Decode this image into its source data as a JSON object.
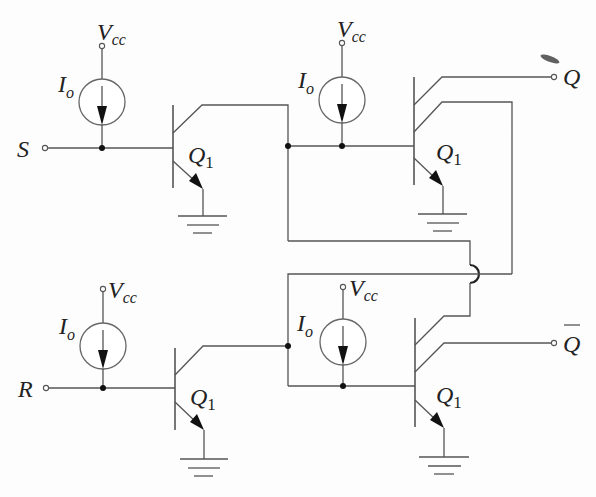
{
  "diagram": {
    "type": "circuit-schematic",
    "inputs": [
      {
        "name": "S",
        "label": "S"
      },
      {
        "name": "R",
        "label": "R"
      }
    ],
    "outputs": [
      {
        "name": "Q",
        "label": "Q"
      },
      {
        "name": "Q_bar",
        "label": "Q",
        "overline": true
      }
    ],
    "supply": {
      "label_main": "V",
      "label_sub": "cc"
    },
    "current_source": {
      "label_main": "I",
      "label_sub": "o"
    },
    "transistor": {
      "label_main": "Q",
      "label_sub": "1"
    },
    "cells": [
      {
        "id": "top-left",
        "input": "S",
        "transistor": "Q1",
        "collectors": 1
      },
      {
        "id": "top-right",
        "transistor": "Q1",
        "collectors": 2,
        "output": "Q"
      },
      {
        "id": "bottom-left",
        "input": "R",
        "transistor": "Q1",
        "collectors": 1
      },
      {
        "id": "bottom-right",
        "transistor": "Q1",
        "collectors": 2,
        "output": "Q_bar"
      }
    ]
  },
  "labels": {
    "S": "S",
    "R": "R",
    "Q": "Q",
    "Qbar": "Q",
    "V": "V",
    "cc": "cc",
    "I": "I",
    "o": "o",
    "Qt": "Q",
    "one": "1"
  },
  "colors": {
    "wire": "#555555",
    "dot": "#111111",
    "background": "#fdfdfd"
  }
}
